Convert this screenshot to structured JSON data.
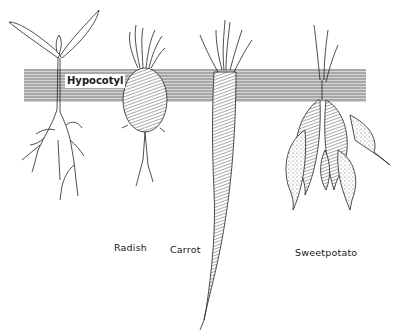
{
  "diagram": {
    "band": {
      "label": "Hypocotyl",
      "color": "#9a9a9a",
      "stripe_color": "#c8c8c8"
    },
    "plants": [
      {
        "name": "seedling",
        "label": ""
      },
      {
        "name": "radish",
        "label": "Radish"
      },
      {
        "name": "carrot",
        "label": "Carrot"
      },
      {
        "name": "sweetpotato",
        "label": "Sweetpotato"
      }
    ]
  }
}
